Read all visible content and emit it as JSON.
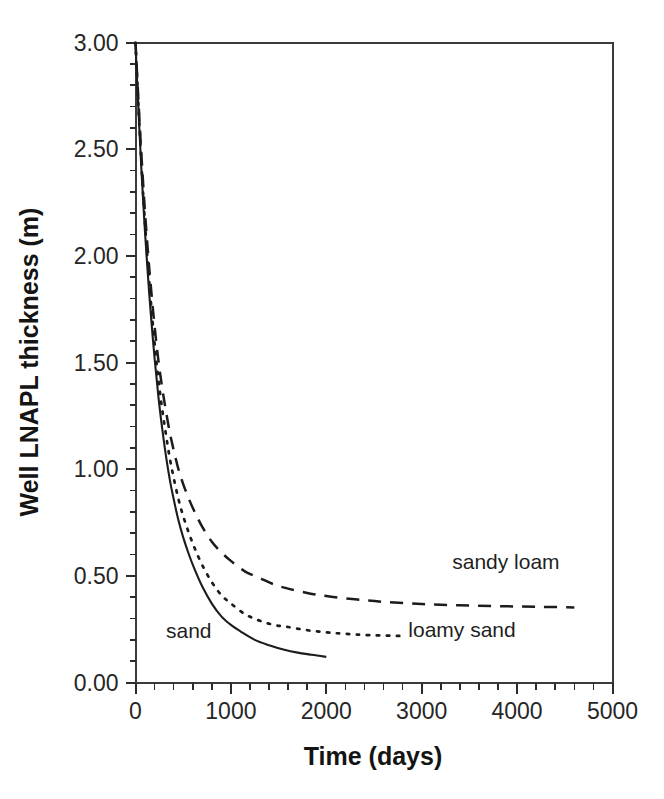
{
  "chart_data": {
    "type": "line",
    "title": "",
    "xlabel": "Time (days)",
    "ylabel": "Well LNAPL thickness (m)",
    "xlim": [
      0,
      5000
    ],
    "ylim": [
      0.0,
      3.0
    ],
    "grid": false,
    "legend_position": "inline-annotations",
    "x_ticks": [
      0,
      1000,
      2000,
      3000,
      4000,
      5000
    ],
    "x_tick_labels": [
      "0",
      "1000",
      "2000",
      "3000",
      "4000",
      "5000"
    ],
    "x_minor_interval": 200,
    "y_ticks": [
      0.0,
      0.5,
      1.0,
      1.5,
      2.0,
      2.5,
      3.0
    ],
    "y_tick_labels": [
      "0.00",
      "0.50",
      "1.00",
      "1.50",
      "2.00",
      "2.50",
      "3.00"
    ],
    "y_minor_interval": 0.1,
    "series": [
      {
        "name": "sand",
        "label": "sand",
        "style": "solid",
        "annotation_x": 320,
        "annotation_y": 0.21,
        "x": [
          0,
          20,
          40,
          60,
          80,
          100,
          130,
          160,
          200,
          240,
          280,
          320,
          360,
          400,
          450,
          500,
          560,
          620,
          700,
          800,
          900,
          1000,
          1100,
          1250,
          1400,
          1550,
          1700,
          1850,
          2000
        ],
        "values": [
          3.0,
          2.79,
          2.6,
          2.42,
          2.26,
          2.11,
          1.91,
          1.73,
          1.52,
          1.34,
          1.19,
          1.06,
          0.95,
          0.86,
          0.76,
          0.68,
          0.6,
          0.53,
          0.45,
          0.37,
          0.31,
          0.27,
          0.24,
          0.2,
          0.175,
          0.155,
          0.14,
          0.13,
          0.12
        ]
      },
      {
        "name": "loamy sand",
        "label": "loamy sand",
        "style": "dotted",
        "annotation_x": 2860,
        "annotation_y": 0.215,
        "x": [
          0,
          20,
          40,
          60,
          80,
          100,
          130,
          160,
          200,
          240,
          280,
          320,
          360,
          400,
          450,
          500,
          560,
          620,
          700,
          800,
          900,
          1000,
          1150,
          1300,
          1450,
          1600,
          1800,
          2000,
          2200,
          2450,
          2800
        ],
        "values": [
          3.0,
          2.8,
          2.62,
          2.45,
          2.29,
          2.15,
          1.96,
          1.79,
          1.59,
          1.42,
          1.28,
          1.16,
          1.05,
          0.96,
          0.86,
          0.78,
          0.7,
          0.63,
          0.55,
          0.47,
          0.41,
          0.37,
          0.32,
          0.29,
          0.27,
          0.26,
          0.245,
          0.235,
          0.228,
          0.222,
          0.218
        ]
      },
      {
        "name": "sandy loam",
        "label": "sandy loam",
        "style": "dashed",
        "annotation_x": 3320,
        "annotation_y": 0.53,
        "x": [
          0,
          20,
          40,
          60,
          80,
          100,
          130,
          160,
          200,
          240,
          280,
          320,
          360,
          400,
          450,
          500,
          560,
          620,
          700,
          800,
          900,
          1000,
          1150,
          1300,
          1450,
          1600,
          1800,
          2000,
          2300,
          2600,
          3000,
          3400,
          3800,
          4200,
          4600
        ],
        "values": [
          3.0,
          2.82,
          2.65,
          2.49,
          2.34,
          2.2,
          2.02,
          1.86,
          1.67,
          1.51,
          1.38,
          1.27,
          1.17,
          1.09,
          1.0,
          0.93,
          0.86,
          0.8,
          0.73,
          0.66,
          0.61,
          0.57,
          0.52,
          0.49,
          0.46,
          0.44,
          0.42,
          0.405,
          0.39,
          0.378,
          0.368,
          0.362,
          0.358,
          0.355,
          0.352
        ]
      }
    ]
  },
  "caption": {
    "partial_text": ""
  }
}
